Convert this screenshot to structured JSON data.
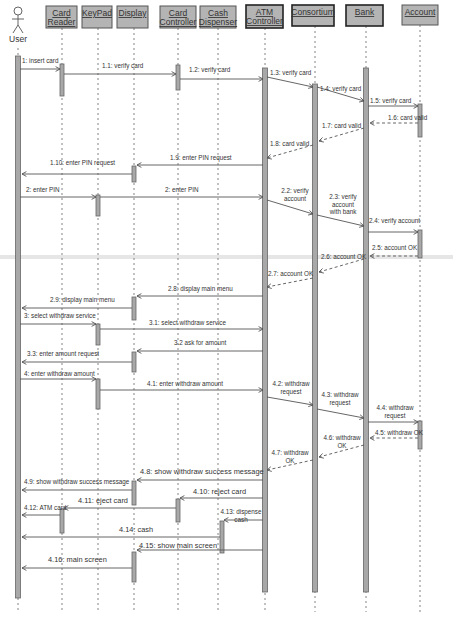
{
  "diagram": {
    "type": "UML sequence diagram",
    "actor": {
      "id": "user",
      "label": "User"
    },
    "objects": [
      {
        "id": "cardreader",
        "lines": [
          "Card",
          "Reader"
        ]
      },
      {
        "id": "keypad",
        "lines": [
          "KeyPad"
        ]
      },
      {
        "id": "display",
        "lines": [
          "Display"
        ]
      },
      {
        "id": "cardctrl",
        "lines": [
          "Card",
          "Controller"
        ]
      },
      {
        "id": "cashdisp",
        "lines": [
          "Cash",
          "Dispenser"
        ]
      },
      {
        "id": "atmctrl",
        "lines": [
          "ATM",
          "Controller"
        ]
      },
      {
        "id": "consortium",
        "lines": [
          "Consortium"
        ]
      },
      {
        "id": "bank",
        "lines": [
          "Bank"
        ]
      },
      {
        "id": "account",
        "lines": [
          "Account"
        ]
      }
    ],
    "messages": [
      {
        "from": "user",
        "to": "cardreader",
        "label": [
          "1: insert card"
        ],
        "kind": "call"
      },
      {
        "from": "cardreader",
        "to": "cardctrl",
        "label": [
          "1.1: verify card"
        ],
        "kind": "call"
      },
      {
        "from": "cardctrl",
        "to": "atmctrl",
        "label": [
          "1.2: verify card"
        ],
        "kind": "call"
      },
      {
        "from": "atmctrl",
        "to": "consortium",
        "label": [
          "1.3: verify card"
        ],
        "kind": "call"
      },
      {
        "from": "consortium",
        "to": "bank",
        "label": [
          "1.4: verify card"
        ],
        "kind": "call"
      },
      {
        "from": "bank",
        "to": "account",
        "label": [
          "1.5: verify card"
        ],
        "kind": "call"
      },
      {
        "from": "account",
        "to": "bank",
        "label": [
          "1.6: card valid"
        ],
        "kind": "return"
      },
      {
        "from": "bank",
        "to": "consortium",
        "label": [
          "1.7: card valid"
        ],
        "kind": "return"
      },
      {
        "from": "consortium",
        "to": "atmctrl",
        "label": [
          "1.8: card valid"
        ],
        "kind": "return"
      },
      {
        "from": "atmctrl",
        "to": "display",
        "label": [
          "1.9: enter PIN request"
        ],
        "kind": "call"
      },
      {
        "from": "display",
        "to": "user",
        "label": [
          "1.10: enter PIN request"
        ],
        "kind": "call"
      },
      {
        "from": "user",
        "to": "keypad",
        "label": [
          "2: enter PIN"
        ],
        "kind": "call"
      },
      {
        "from": "keypad",
        "to": "atmctrl",
        "label": [
          "2: enter PIN"
        ],
        "kind": "call"
      },
      {
        "from": "atmctrl",
        "to": "consortium",
        "label": [
          "2.2: verify",
          "account"
        ],
        "kind": "call"
      },
      {
        "from": "consortium",
        "to": "bank",
        "label": [
          "2.3: verify",
          "account",
          "with bank"
        ],
        "kind": "call"
      },
      {
        "from": "bank",
        "to": "account",
        "label": [
          "2.4: verify account"
        ],
        "kind": "call"
      },
      {
        "from": "account",
        "to": "bank",
        "label": [
          "2.5: account OK"
        ],
        "kind": "return"
      },
      {
        "from": "bank",
        "to": "consortium",
        "label": [
          "2.6: account OK"
        ],
        "kind": "return"
      },
      {
        "from": "consortium",
        "to": "atmctrl",
        "label": [
          "2.7: account OK"
        ],
        "kind": "return"
      },
      {
        "from": "atmctrl",
        "to": "display",
        "label": [
          "2.8: display main menu"
        ],
        "kind": "call"
      },
      {
        "from": "display",
        "to": "user",
        "label": [
          "2.9: display main menu"
        ],
        "kind": "call"
      },
      {
        "from": "user",
        "to": "keypad",
        "label": [
          "3: select withdraw service"
        ],
        "kind": "call"
      },
      {
        "from": "keypad",
        "to": "atmctrl",
        "label": [
          "3.1: select withdraw service"
        ],
        "kind": "call"
      },
      {
        "from": "atmctrl",
        "to": "display",
        "label": [
          "3.2 ask for amount"
        ],
        "kind": "call"
      },
      {
        "from": "display",
        "to": "user",
        "label": [
          "3.3: enter amount request"
        ],
        "kind": "call"
      },
      {
        "from": "user",
        "to": "keypad",
        "label": [
          "4: enter withdraw amount"
        ],
        "kind": "call"
      },
      {
        "from": "keypad",
        "to": "atmctrl",
        "label": [
          "4.1: enter withdraw amount"
        ],
        "kind": "call"
      },
      {
        "from": "atmctrl",
        "to": "consortium",
        "label": [
          "4.2: withdraw",
          "request"
        ],
        "kind": "call"
      },
      {
        "from": "consortium",
        "to": "bank",
        "label": [
          "4.3: withdraw",
          "request"
        ],
        "kind": "call"
      },
      {
        "from": "bank",
        "to": "account",
        "label": [
          "4.4: withdraw",
          "request"
        ],
        "kind": "call"
      },
      {
        "from": "account",
        "to": "bank",
        "label": [
          "4.5: withdraw OK"
        ],
        "kind": "return"
      },
      {
        "from": "bank",
        "to": "consortium",
        "label": [
          "4.6: withdraw",
          "OK"
        ],
        "kind": "return"
      },
      {
        "from": "consortium",
        "to": "atmctrl",
        "label": [
          "4.7: withdraw",
          "OK"
        ],
        "kind": "return"
      },
      {
        "from": "atmctrl",
        "to": "display",
        "label": [
          "4.8: show withdraw success message"
        ],
        "kind": "call"
      },
      {
        "from": "display",
        "to": "user",
        "label": [
          "4.9: show withdraw success message"
        ],
        "kind": "call"
      },
      {
        "from": "atmctrl",
        "to": "cardctrl",
        "label": [
          "4.10: reject card"
        ],
        "kind": "call"
      },
      {
        "from": "cardctrl",
        "to": "cardreader",
        "label": [
          "4.11: eject card"
        ],
        "kind": "call"
      },
      {
        "from": "cardreader",
        "to": "user",
        "label": [
          "4.12: ATM card"
        ],
        "kind": "call"
      },
      {
        "from": "atmctrl",
        "to": "cashdisp",
        "label": [
          "4.13: dispense",
          "cash"
        ],
        "kind": "call"
      },
      {
        "from": "cashdisp",
        "to": "user",
        "label": [
          "4.14: cash"
        ],
        "kind": "call"
      },
      {
        "from": "atmctrl",
        "to": "display",
        "label": [
          "4.15: show main screen"
        ],
        "kind": "call"
      },
      {
        "from": "display",
        "to": "user",
        "label": [
          "4.16: main screen"
        ],
        "kind": "call"
      }
    ]
  }
}
